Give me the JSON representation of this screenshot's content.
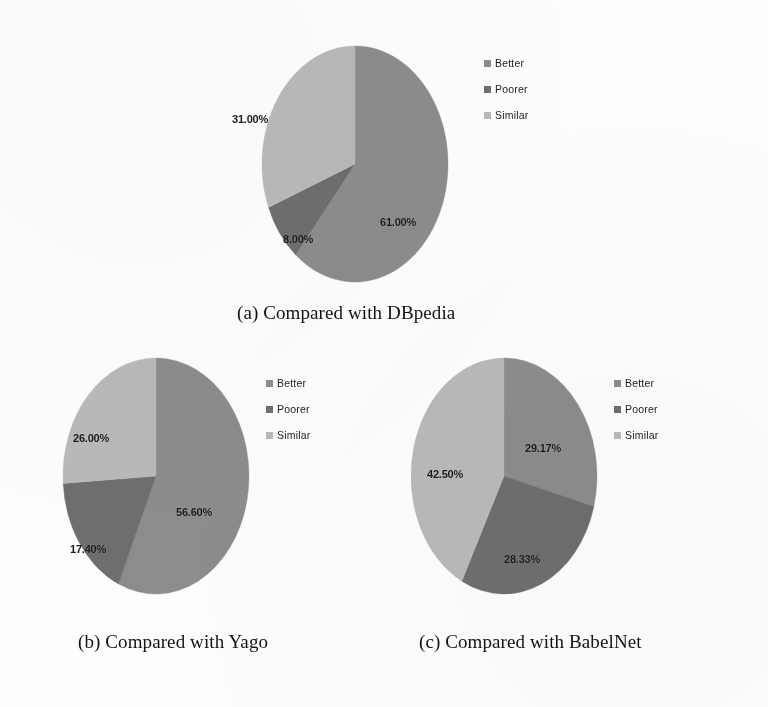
{
  "figure": {
    "legend_labels": [
      "Better",
      "Poorer",
      "Similar"
    ],
    "colors": {
      "better": "#8c8c8c",
      "poorer": "#6e6e6e",
      "similar": "#b9b9b9",
      "label_text": "#1b1b1b",
      "caption_text": "#121212",
      "background": "#fdfdfc"
    }
  },
  "chart_data": [
    {
      "type": "pie",
      "title": "(a) Compared with DBpedia",
      "categories": [
        "Better",
        "Poorer",
        "Similar"
      ],
      "values": [
        61.0,
        8.0,
        31.0
      ],
      "labels": [
        "61.00%",
        "8.00%",
        "31.00%"
      ],
      "colors": [
        "#8c8c8c",
        "#6e6e6e",
        "#b9b9b9"
      ],
      "legend_position": "right",
      "start_angle_deg": 0,
      "direction": "clockwise",
      "grid": false,
      "xlabel": "",
      "ylabel": ""
    },
    {
      "type": "pie",
      "title": "(b) Compared with Yago",
      "categories": [
        "Better",
        "Poorer",
        "Similar"
      ],
      "values": [
        56.6,
        17.4,
        26.0
      ],
      "labels": [
        "56.60%",
        "17.40%",
        "26.00%"
      ],
      "colors": [
        "#8c8c8c",
        "#6e6e6e",
        "#b9b9b9"
      ],
      "legend_position": "right",
      "start_angle_deg": 0,
      "direction": "clockwise",
      "grid": false,
      "xlabel": "",
      "ylabel": ""
    },
    {
      "type": "pie",
      "title": "(c) Compared with BabelNet",
      "categories": [
        "Better",
        "Poorer",
        "Similar"
      ],
      "values": [
        29.17,
        28.33,
        42.5
      ],
      "labels": [
        "29.17%",
        "28.33%",
        "42.50%"
      ],
      "colors": [
        "#8c8c8c",
        "#6e6e6e",
        "#b9b9b9"
      ],
      "legend_position": "right",
      "start_angle_deg": 0,
      "direction": "clockwise",
      "grid": false,
      "xlabel": "",
      "ylabel": ""
    }
  ],
  "charts": {
    "a": {
      "caption": "(a) Compared with DBpedia",
      "legend": [
        {
          "label": "Better",
          "color": "#8c8c8c"
        },
        {
          "label": "Poorer",
          "color": "#6e6e6e"
        },
        {
          "label": "Similar",
          "color": "#b9b9b9"
        }
      ],
      "slices": [
        {
          "name": "Better",
          "value": 61.0,
          "label": "61.00%"
        },
        {
          "name": "Poorer",
          "value": 8.0,
          "label": "8.00%"
        },
        {
          "name": "Similar",
          "value": 31.0,
          "label": "31.00%"
        }
      ]
    },
    "b": {
      "caption": "(b) Compared with Yago",
      "legend": [
        {
          "label": "Better",
          "color": "#8c8c8c"
        },
        {
          "label": "Poorer",
          "color": "#6e6e6e"
        },
        {
          "label": "Similar",
          "color": "#b9b9b9"
        }
      ],
      "slices": [
        {
          "name": "Better",
          "value": 56.6,
          "label": "56.60%"
        },
        {
          "name": "Poorer",
          "value": 17.4,
          "label": "17.40%"
        },
        {
          "name": "Similar",
          "value": 26.0,
          "label": "26.00%"
        }
      ]
    },
    "c": {
      "caption": "(c) Compared with BabelNet",
      "legend": [
        {
          "label": "Better",
          "color": "#8c8c8c"
        },
        {
          "label": "Poorer",
          "color": "#6e6e6e"
        },
        {
          "label": "Similar",
          "color": "#b9b9b9"
        }
      ],
      "slices": [
        {
          "name": "Better",
          "value": 29.17,
          "label": "29.17%"
        },
        {
          "name": "Poorer",
          "value": 28.33,
          "label": "28.33%"
        },
        {
          "name": "Similar",
          "value": 42.5,
          "label": "42.50%"
        }
      ]
    }
  }
}
